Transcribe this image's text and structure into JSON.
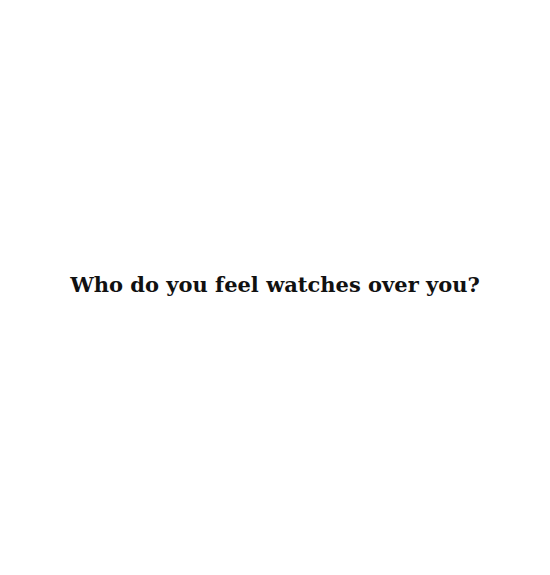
{
  "page": {
    "question": "Who do you feel watches over you?",
    "background_color": "#ffffff",
    "text_color": "#111111"
  }
}
